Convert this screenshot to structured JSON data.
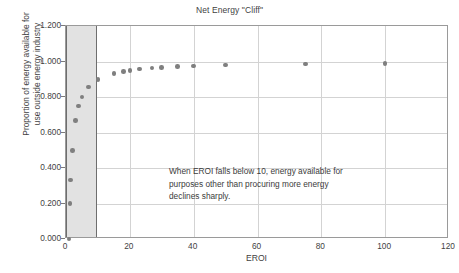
{
  "chart_data": {
    "type": "scatter",
    "title": "Net Energy \"Cliff\"",
    "xlabel": "EROI",
    "ylabel_line1": "Proportion of energy available for",
    "ylabel_line2": "use outside energy industry",
    "xlim": [
      0,
      120
    ],
    "ylim": [
      0,
      1.2
    ],
    "xticks": [
      0,
      20,
      40,
      60,
      80,
      100,
      120
    ],
    "xtick_labels": [
      "0",
      "20",
      "40",
      "60",
      "80",
      "100",
      "120"
    ],
    "yticks": [
      0.0,
      0.2,
      0.4,
      0.6,
      0.8,
      1.0,
      1.2
    ],
    "ytick_labels": [
      "0.000",
      "0.200",
      "0.400",
      "0.600",
      "0.800",
      "1.000",
      "1.200"
    ],
    "grid": true,
    "legend": null,
    "marker_color": "#7f7f7f",
    "shaded_region": {
      "label": "cliff-band",
      "x_start": 0,
      "x_end": 9.6,
      "color": "#e2e2e2"
    },
    "annotation": {
      "lines": [
        "When EROI falls below 10, energy available for",
        "purposes other than procuring more energy",
        "declines sharply."
      ]
    },
    "x": [
      1,
      1.25,
      1.5,
      2,
      3,
      4,
      5,
      7,
      10,
      15,
      18,
      20,
      23,
      27,
      30,
      35,
      40,
      50,
      75,
      100
    ],
    "y": [
      0.0,
      0.2,
      0.333,
      0.5,
      0.667,
      0.75,
      0.8,
      0.857,
      0.9,
      0.933,
      0.944,
      0.95,
      0.957,
      0.963,
      0.967,
      0.971,
      0.975,
      0.98,
      0.987,
      0.99
    ],
    "series": [
      {
        "name": "Proportion of energy available for use outside energy industry",
        "points": [
          {
            "x": 1,
            "y": 0.0
          },
          {
            "x": 1.25,
            "y": 0.2
          },
          {
            "x": 1.5,
            "y": 0.333
          },
          {
            "x": 2,
            "y": 0.5
          },
          {
            "x": 3,
            "y": 0.667
          },
          {
            "x": 4,
            "y": 0.75
          },
          {
            "x": 5,
            "y": 0.8
          },
          {
            "x": 7,
            "y": 0.857
          },
          {
            "x": 10,
            "y": 0.9
          },
          {
            "x": 15,
            "y": 0.933
          },
          {
            "x": 18,
            "y": 0.944
          },
          {
            "x": 20,
            "y": 0.95
          },
          {
            "x": 23,
            "y": 0.957
          },
          {
            "x": 27,
            "y": 0.963
          },
          {
            "x": 30,
            "y": 0.967
          },
          {
            "x": 35,
            "y": 0.971
          },
          {
            "x": 40,
            "y": 0.975
          },
          {
            "x": 50,
            "y": 0.98
          },
          {
            "x": 75,
            "y": 0.987
          },
          {
            "x": 100,
            "y": 0.99
          }
        ]
      }
    ]
  }
}
